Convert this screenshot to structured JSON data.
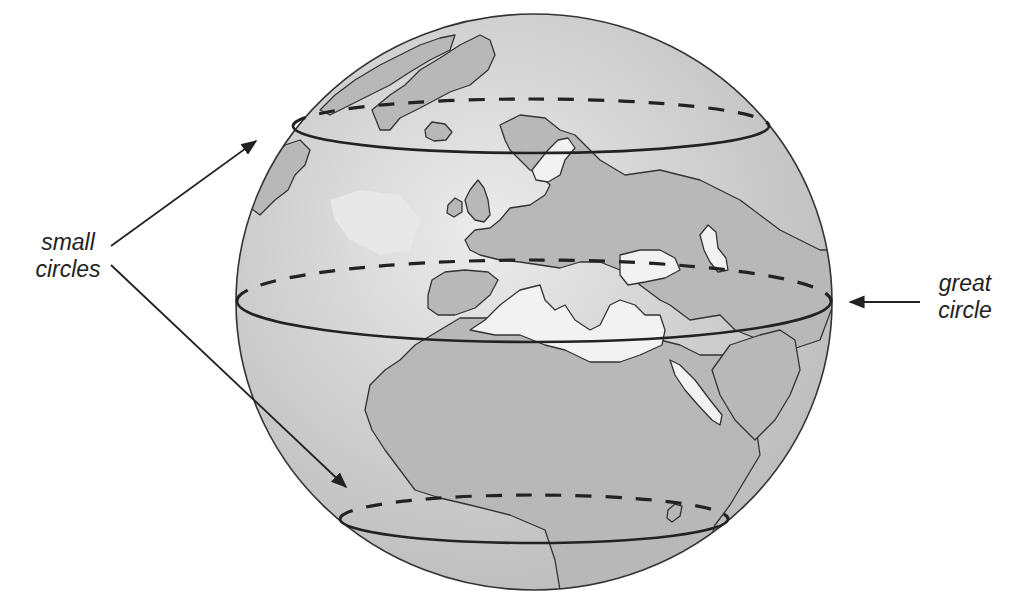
{
  "diagram": {
    "labels": {
      "small_circles": [
        "small",
        "circles"
      ],
      "great_circle": [
        "great",
        "circle"
      ]
    },
    "elements": [
      {
        "type": "sphere",
        "name": "globe",
        "shading": "gray radial"
      },
      {
        "type": "small-circle",
        "position": "upper",
        "front": "solid",
        "back": "dashed"
      },
      {
        "type": "great-circle",
        "position": "equatorial",
        "front": "solid",
        "back": "dashed"
      },
      {
        "type": "small-circle",
        "position": "lower",
        "front": "solid",
        "back": "dashed"
      }
    ],
    "arrows": [
      {
        "from_label": "small circles",
        "to": "upper small circle"
      },
      {
        "from_label": "small circles",
        "to": "lower small circle"
      },
      {
        "from_label": "great circle",
        "to": "great circle"
      }
    ]
  },
  "colors": {
    "globe_fill": "#c9c9c9",
    "globe_highlight": "#ececec",
    "land": "#b8b8b8",
    "water_highlight": "#f2f2f2",
    "lines": "#222222",
    "text": "#222222"
  }
}
